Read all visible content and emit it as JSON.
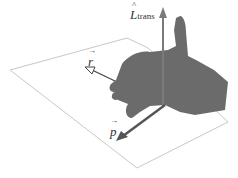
{
  "diagram": {
    "labels": {
      "L": "L",
      "L_sub": "trans",
      "r": "r",
      "p": "p"
    },
    "colors": {
      "hand": "#6b6b6b",
      "plane": "#c8c8c8",
      "L_arrow": "#7a7a7a",
      "r_arrow": "#444444",
      "p_arrow": "#555555"
    }
  }
}
